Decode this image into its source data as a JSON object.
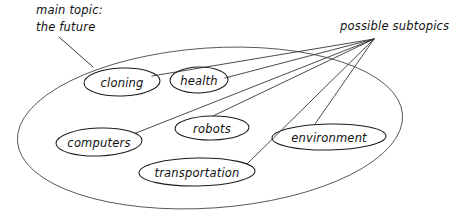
{
  "diagram": {
    "type": "concept-map",
    "style": "hand-drawn",
    "background_color": "#ffffff",
    "line_color": "#2a2a2a",
    "text_color": "#111111",
    "annotations": {
      "main_topic": {
        "line1": "main topic:",
        "line2": "the future"
      },
      "subtopics_label": "possible subtopics"
    },
    "main_oval": {
      "label_ref": "main topic: the future",
      "cx": 210,
      "cy": 128,
      "rx": 193,
      "ry": 80,
      "rotation": -4
    },
    "subtopics": [
      {
        "label": "cloning",
        "cx": 122,
        "cy": 82,
        "rx": 38,
        "ry": 14,
        "rotation": -2
      },
      {
        "label": "health",
        "cx": 199,
        "cy": 80,
        "rx": 29,
        "ry": 13,
        "rotation": -1
      },
      {
        "label": "computers",
        "cx": 99,
        "cy": 142,
        "rx": 43,
        "ry": 14,
        "rotation": -2
      },
      {
        "label": "robots",
        "cx": 212,
        "cy": 128,
        "rx": 37,
        "ry": 12,
        "rotation": -1
      },
      {
        "label": "transportation",
        "cx": 197,
        "cy": 172,
        "rx": 58,
        "ry": 14,
        "rotation": -1
      },
      {
        "label": "environment",
        "cx": 329,
        "cy": 137,
        "rx": 57,
        "ry": 13,
        "rotation": -1
      }
    ],
    "convergence_point": {
      "x": 374,
      "y": 39
    },
    "main_leader_line": {
      "from_x": 59,
      "from_y": 37,
      "to_x": 92,
      "to_y": 66
    }
  }
}
